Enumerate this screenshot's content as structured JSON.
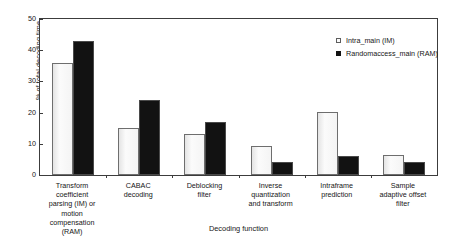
{
  "chart_data": {
    "type": "bar",
    "title": "",
    "xlabel": "Decoding function",
    "ylabel": "% of total decoding time",
    "ylim": [
      0,
      50
    ],
    "yticks": [
      0,
      10,
      20,
      30,
      40,
      50
    ],
    "grid": false,
    "legend_position": "top-right",
    "categories": [
      "Transform coefficient parsing (IM) or motion compensation (RAM)",
      "CABAC decoding",
      "Deblocking filter",
      "Inverse quantization and transform",
      "Intraframe prediction",
      "Sample adaptive offset filter"
    ],
    "category_lines": [
      [
        "Transform coefficient",
        "parsing (IM) or motion",
        "compensation (RAM)"
      ],
      [
        "CABAC",
        "decoding"
      ],
      [
        "Deblocking",
        "filter"
      ],
      [
        "Inverse",
        "quantization",
        "and transform"
      ],
      [
        "Intraframe",
        "prediction"
      ],
      [
        "Sample",
        "adaptive offset",
        "filter"
      ]
    ],
    "series": [
      {
        "name": "Intra_main (IM)",
        "color": "#f7f7f7",
        "values": [
          36.0,
          15.0,
          13.3,
          9.3,
          20.3,
          6.3
        ]
      },
      {
        "name": "Randomaccess_main (RAM)",
        "color": "#121212",
        "values": [
          43.0,
          24.2,
          17.0,
          4.3,
          6.2,
          4.3
        ]
      }
    ]
  },
  "axis": {
    "ytick_labels": [
      "0",
      "10",
      "20",
      "30",
      "40",
      "50"
    ],
    "y_axis_title": "% of total decoding time",
    "x_axis_title": "Decoding function"
  },
  "legend": {
    "entries": [
      {
        "label": "Intra_main (IM)",
        "swatch": "light"
      },
      {
        "label": "Randomaccess_main (RAM)",
        "swatch": "dark"
      }
    ]
  }
}
